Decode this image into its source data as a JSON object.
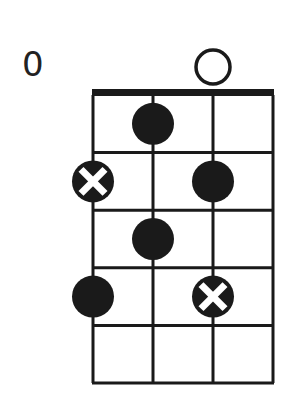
{
  "diagram": {
    "type": "chord-diagram",
    "instrument": "4-string",
    "position_label": "0",
    "strings": 4,
    "frets": 5,
    "open_strings": [
      3
    ],
    "markers": [
      {
        "string": 2,
        "fret": 1,
        "style": "filled"
      },
      {
        "string": 1,
        "fret": 2,
        "style": "x"
      },
      {
        "string": 3,
        "fret": 2,
        "style": "filled"
      },
      {
        "string": 2,
        "fret": 3,
        "style": "filled"
      },
      {
        "string": 1,
        "fret": 4,
        "style": "filled"
      },
      {
        "string": 3,
        "fret": 4,
        "style": "x"
      }
    ],
    "colors": {
      "ink": "#1a1a1a",
      "background": "#ffffff"
    }
  }
}
